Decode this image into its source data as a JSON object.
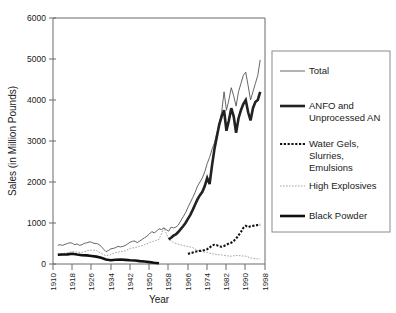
{
  "chart_data": {
    "type": "line",
    "title": "",
    "xlabel": "Year",
    "ylabel": "Sales (in Million Pounds)",
    "xlim": [
      1910,
      1998
    ],
    "ylim": [
      0,
      6000
    ],
    "grid": false,
    "legend_position": "right",
    "xticks": [
      "1910",
      "1918",
      "1926",
      "1934",
      "1942",
      "1950",
      "1958",
      "1966",
      "1974",
      "1982",
      "1990",
      "1998"
    ],
    "yticks": [
      "0",
      "1000",
      "2000",
      "3000",
      "4000",
      "5000",
      "6000"
    ],
    "series": [
      {
        "name": "Total",
        "style": "thin-solid",
        "color": "#555555",
        "x": [
          1912,
          1913,
          1914,
          1915,
          1916,
          1917,
          1918,
          1919,
          1920,
          1921,
          1922,
          1923,
          1924,
          1925,
          1926,
          1927,
          1928,
          1929,
          1930,
          1931,
          1932,
          1933,
          1934,
          1935,
          1936,
          1937,
          1938,
          1939,
          1940,
          1941,
          1942,
          1943,
          1944,
          1945,
          1946,
          1947,
          1948,
          1949,
          1950,
          1951,
          1952,
          1953,
          1954,
          1955,
          1956,
          1957,
          1958,
          1959,
          1960,
          1961,
          1962,
          1963,
          1964,
          1965,
          1966,
          1967,
          1968,
          1969,
          1970,
          1971,
          1972,
          1973,
          1974,
          1975,
          1976,
          1977,
          1978,
          1979,
          1980,
          1981,
          1982,
          1983,
          1984,
          1985,
          1986,
          1987,
          1988,
          1989,
          1990,
          1991,
          1992,
          1993,
          1994,
          1995,
          1996
        ],
        "values": [
          460,
          470,
          455,
          480,
          500,
          520,
          505,
          470,
          490,
          455,
          470,
          505,
          515,
          540,
          530,
          505,
          500,
          480,
          430,
          360,
          300,
          330,
          370,
          380,
          400,
          430,
          415,
          430,
          450,
          490,
          530,
          555,
          560,
          520,
          560,
          600,
          640,
          680,
          730,
          790,
          760,
          800,
          860,
          840,
          880,
          840,
          800,
          900,
          880,
          900,
          950,
          1050,
          1150,
          1250,
          1380,
          1500,
          1620,
          1750,
          1900,
          2000,
          2100,
          2250,
          2450,
          2600,
          2800,
          2950,
          3200,
          3400,
          3700,
          4200,
          3750,
          4000,
          4300,
          4100,
          3850,
          4200,
          4400,
          4600,
          4680,
          4350,
          4000,
          4200,
          4400,
          4600,
          4980
        ]
      },
      {
        "name": "ANFO and Unprocessed AN",
        "style": "thick-solid",
        "color": "#222222",
        "x": [
          1958,
          1959,
          1960,
          1961,
          1962,
          1963,
          1964,
          1965,
          1966,
          1967,
          1968,
          1969,
          1970,
          1971,
          1972,
          1973,
          1974,
          1975,
          1976,
          1977,
          1978,
          1979,
          1980,
          1981,
          1982,
          1983,
          1984,
          1985,
          1986,
          1987,
          1988,
          1989,
          1990,
          1991,
          1992,
          1993,
          1994,
          1995,
          1996
        ],
        "values": [
          600,
          640,
          690,
          720,
          780,
          850,
          920,
          1000,
          1100,
          1200,
          1320,
          1450,
          1580,
          1680,
          1760,
          1900,
          2100,
          1950,
          2400,
          2800,
          3100,
          3400,
          3600,
          3750,
          3250,
          3500,
          3800,
          3600,
          3200,
          3550,
          3750,
          3900,
          4000,
          3700,
          3500,
          3800,
          3950,
          4000,
          4200
        ]
      },
      {
        "name": "Water Gels, Slurries, Emulsions",
        "style": "thick-dotted",
        "color": "#111111",
        "x": [
          1966,
          1967,
          1968,
          1969,
          1970,
          1971,
          1972,
          1973,
          1974,
          1975,
          1976,
          1977,
          1978,
          1979,
          1980,
          1981,
          1982,
          1983,
          1984,
          1985,
          1986,
          1987,
          1988,
          1989,
          1990,
          1991,
          1992,
          1993,
          1994,
          1995,
          1996
        ],
        "values": [
          250,
          260,
          280,
          300,
          310,
          320,
          330,
          340,
          360,
          400,
          450,
          470,
          460,
          430,
          420,
          440,
          470,
          500,
          520,
          560,
          620,
          700,
          780,
          880,
          930,
          900,
          920,
          930,
          940,
          950,
          960
        ]
      },
      {
        "name": "High Explosives",
        "style": "thin-dotted",
        "color": "#999999",
        "x": [
          1912,
          1914,
          1916,
          1918,
          1920,
          1922,
          1924,
          1926,
          1928,
          1930,
          1932,
          1934,
          1936,
          1938,
          1940,
          1942,
          1944,
          1946,
          1948,
          1950,
          1952,
          1954,
          1956,
          1958,
          1960,
          1962,
          1964,
          1966,
          1968,
          1970,
          1972,
          1974,
          1976,
          1978,
          1980,
          1982,
          1984,
          1986,
          1988,
          1990,
          1992,
          1994,
          1996
        ],
        "values": [
          240,
          250,
          280,
          300,
          290,
          280,
          320,
          340,
          330,
          260,
          200,
          230,
          280,
          300,
          320,
          380,
          400,
          430,
          470,
          520,
          560,
          600,
          880,
          620,
          520,
          480,
          450,
          430,
          400,
          330,
          300,
          280,
          250,
          230,
          220,
          200,
          190,
          210,
          200,
          190,
          150,
          130,
          120
        ]
      },
      {
        "name": "Black Powder",
        "style": "thick-solid",
        "color": "#111111",
        "x": [
          1912,
          1914,
          1916,
          1918,
          1920,
          1922,
          1924,
          1926,
          1928,
          1930,
          1932,
          1934,
          1936,
          1938,
          1940,
          1942,
          1944,
          1946,
          1948,
          1950,
          1952,
          1954
        ],
        "values": [
          225,
          230,
          235,
          250,
          230,
          215,
          210,
          195,
          180,
          150,
          110,
          90,
          105,
          110,
          100,
          90,
          85,
          70,
          60,
          45,
          30,
          20
        ]
      }
    ]
  },
  "legend": {
    "items": [
      {
        "label": "Total",
        "label2": ""
      },
      {
        "label": "ANFO and",
        "label2": "Unprocessed AN"
      },
      {
        "label": "Water Gels,",
        "label2": "Slurries,",
        "label3": "Emulsions"
      },
      {
        "label": "High Explosives",
        "label2": ""
      },
      {
        "label": "Black Powder",
        "label2": ""
      }
    ]
  }
}
